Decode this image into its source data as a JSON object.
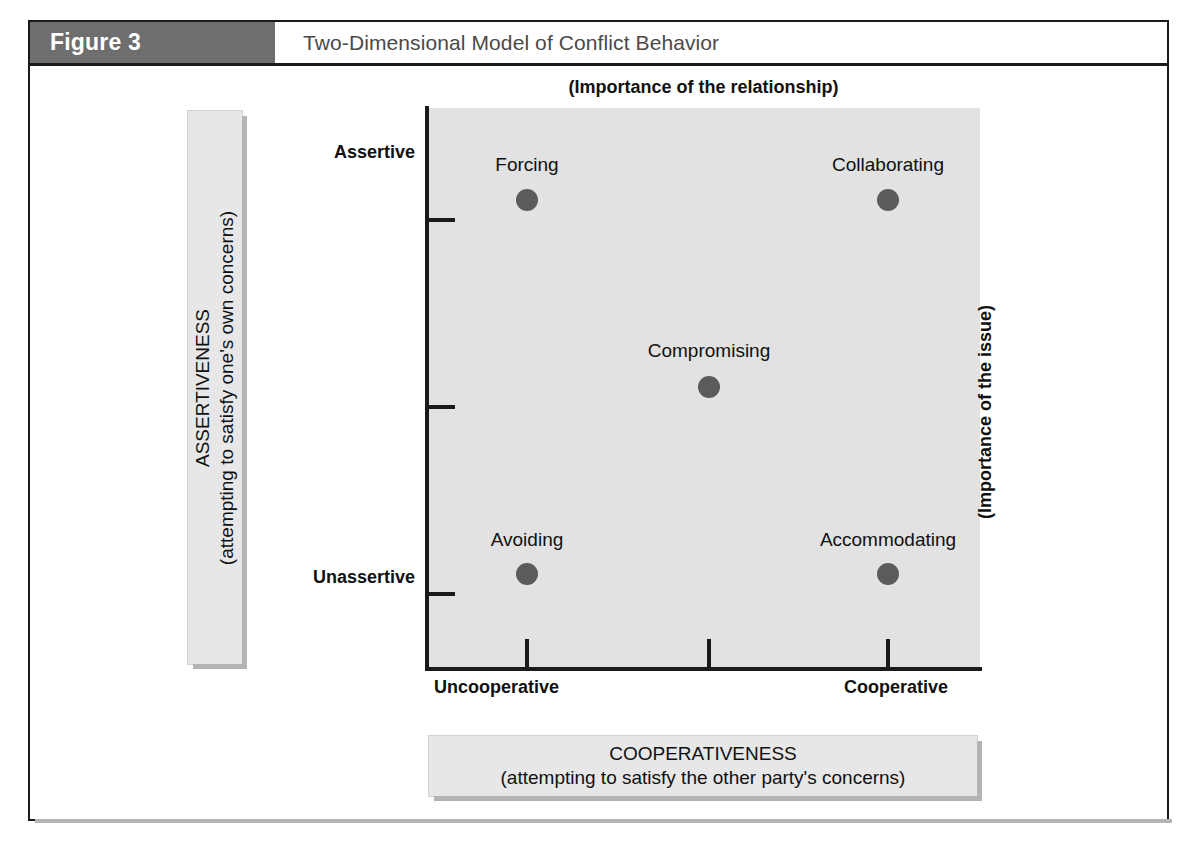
{
  "figure": {
    "number_label": "Figure 3",
    "title": "Two-Dimensional Model of Conflict Behavior"
  },
  "axes": {
    "top_caption": "(Importance of the relationship)",
    "right_caption": "(Importance of the issue)",
    "y_axis": {
      "name": "ASSERTIVENESS",
      "sub": "(attempting to satisfy one's own concerns)",
      "high_label": "Assertive",
      "low_label": "Unassertive"
    },
    "x_axis": {
      "name": "COOPERATIVENESS",
      "sub": "(attempting to satisfy the other party's concerns)",
      "low_label": "Uncooperative",
      "high_label": "Cooperative"
    }
  },
  "colors": {
    "header_band": "#6e6e6e",
    "plot_background": "#e2e2e2",
    "data_point": "#5b5b5b",
    "caption_panel": "#e7e7e7",
    "axis_line": "#1a1a1a"
  },
  "chart_data": {
    "type": "scatter",
    "title": "Two-Dimensional Model of Conflict Behavior",
    "xlabel": "COOPERATIVENESS (attempting to satisfy the other party's concerns)",
    "ylabel": "ASSERTIVENESS (attempting to satisfy one's own concerns)",
    "xlim": [
      0,
      100
    ],
    "ylim": [
      0,
      100
    ],
    "grid": false,
    "legend": "none",
    "x_tick_labels": [
      "Uncooperative",
      "",
      "Cooperative"
    ],
    "y_tick_labels": [
      "Assertive",
      "",
      "Unassertive"
    ],
    "x_tick_positions": [
      10,
      50,
      90
    ],
    "y_tick_positions": [
      84,
      50,
      16
    ],
    "points": [
      {
        "label": "Forcing",
        "x": 18,
        "y": 84,
        "label_position": "above"
      },
      {
        "label": "Collaborating",
        "x": 83,
        "y": 84,
        "label_position": "above"
      },
      {
        "label": "Compromising",
        "x": 51,
        "y": 50,
        "label_position": "above"
      },
      {
        "label": "Avoiding",
        "x": 18,
        "y": 16,
        "label_position": "above"
      },
      {
        "label": "Accommodating",
        "x": 83,
        "y": 16,
        "label_position": "above"
      }
    ]
  },
  "point_pixels": [
    {
      "x": 525,
      "y": 198,
      "label_x": 525,
      "label_y": 152
    },
    {
      "x": 886,
      "y": 198,
      "label_x": 886,
      "label_y": 152
    },
    {
      "x": 707,
      "y": 385,
      "label_x": 707,
      "label_y": 338
    },
    {
      "x": 525,
      "y": 572,
      "label_x": 525,
      "label_y": 527
    },
    {
      "x": 886,
      "y": 572,
      "label_x": 886,
      "label_y": 527
    }
  ],
  "tick_pixels": {
    "y": [
      198,
      385,
      572
    ],
    "x": [
      525,
      707,
      886
    ]
  }
}
